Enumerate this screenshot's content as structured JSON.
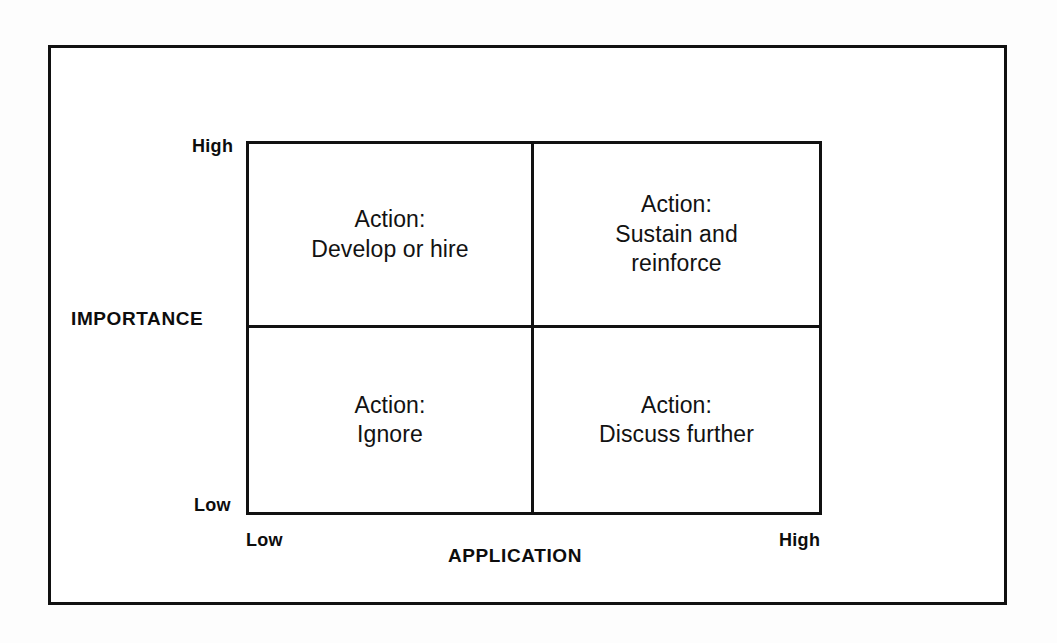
{
  "figure": {
    "type": "2x2-matrix",
    "frame_color": "#111111",
    "background_color": "#ffffff"
  },
  "axes": {
    "y": {
      "title": "IMPORTANCE",
      "high_label": "High",
      "low_label": "Low"
    },
    "x": {
      "title": "APPLICATION",
      "low_label": "Low",
      "high_label": "High"
    }
  },
  "chart_data": {
    "type": "table",
    "title": "",
    "xlabel": "APPLICATION",
    "ylabel": "IMPORTANCE",
    "x_tick_labels": [
      "Low",
      "High"
    ],
    "y_tick_labels": [
      "Low",
      "High"
    ],
    "grid": true,
    "legend": "none",
    "quadrants": [
      {
        "id": "top-left",
        "importance": "High",
        "application": "Low",
        "text": "Action:\nDevelop or hire"
      },
      {
        "id": "top-right",
        "importance": "High",
        "application": "High",
        "text": "Action:\nSustain and\nreinforce"
      },
      {
        "id": "bottom-left",
        "importance": "Low",
        "application": "Low",
        "text": "Action:\nIgnore"
      },
      {
        "id": "bottom-right",
        "importance": "Low",
        "application": "High",
        "text": "Action:\nDiscuss further"
      }
    ]
  }
}
